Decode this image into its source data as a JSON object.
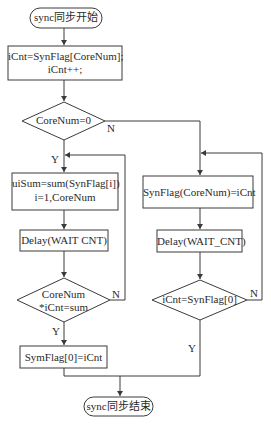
{
  "flowchart": {
    "start": {
      "label": "sync同步开始"
    },
    "end": {
      "label": "sync同步结束"
    },
    "init_box": {
      "line1": "iCnt=SynFlag[CoreNum];",
      "line2": "iCnt++;"
    },
    "decision_main": {
      "label": "CoreNum=0",
      "yes": "Y",
      "no": "N"
    },
    "left_branch": {
      "sum_box": {
        "line1": "uiSum=sum(SynFlag[i])",
        "line2": "i=1,CoreNum"
      },
      "delay_box": {
        "label": "Delay(WAIT CNT)"
      },
      "decision": {
        "line1": "CoreNum",
        "line2": "*iCnt=sum",
        "yes": "Y",
        "no": "N"
      },
      "set_box": {
        "label": "SymFlag[0]=iCnt"
      }
    },
    "right_branch": {
      "set_box": {
        "label": "SynFlag(CoreNum)=iCnt"
      },
      "delay_box": {
        "label": "Delay(WAIT_CNT)"
      },
      "decision": {
        "label": "iCnt=SynFlag[0]",
        "yes": "Y",
        "no": "N"
      }
    }
  },
  "colors": {
    "line": "#3a3a3a",
    "text": "#2a2a2a",
    "background": "#ffffff"
  }
}
